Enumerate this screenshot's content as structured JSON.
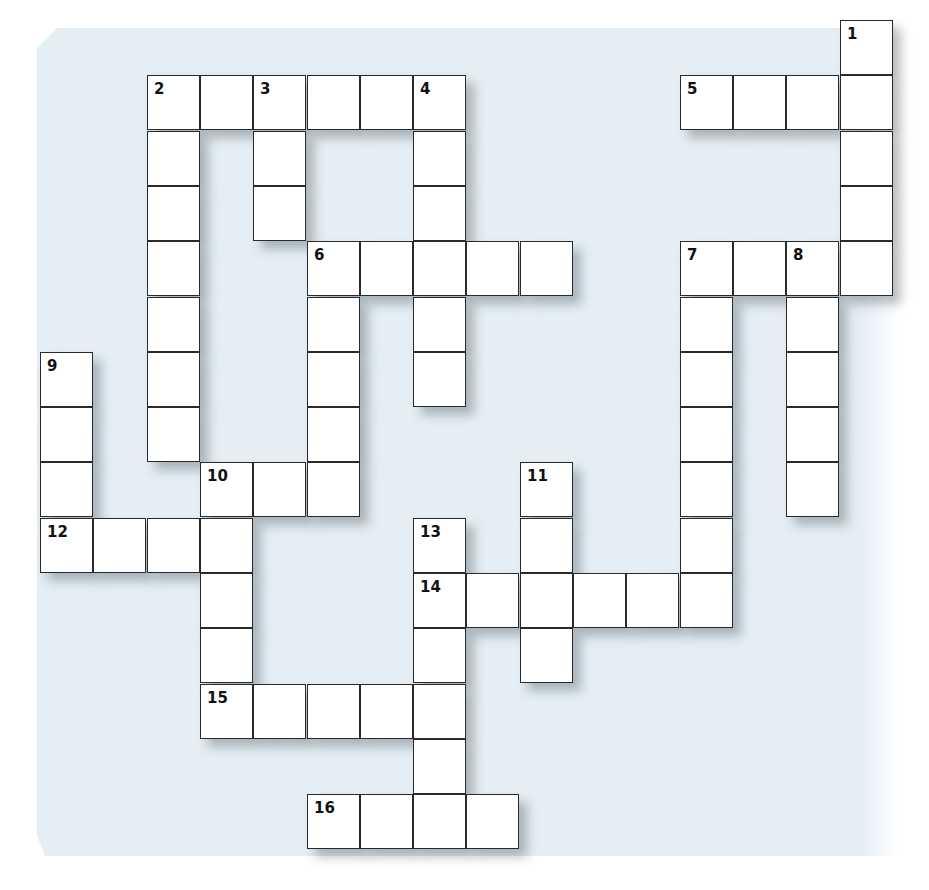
{
  "puzzle": {
    "type": "crossword",
    "grid_origin": {
      "x": 40,
      "y": 20
    },
    "cell_size": {
      "w": 53.3,
      "h": 55.3
    },
    "colors": {
      "background": "#e4eef4",
      "cell": "#ffffff",
      "border": "#2a2a2a",
      "number": "#111111"
    },
    "entries": [
      {
        "number": "1",
        "direction": "down",
        "row": 0,
        "col": 15,
        "length": 5
      },
      {
        "number": "2",
        "direction": "across",
        "row": 1,
        "col": 2,
        "length": 6
      },
      {
        "number": "2",
        "direction": "down",
        "row": 1,
        "col": 2,
        "length": 7
      },
      {
        "number": "3",
        "direction": "down",
        "row": 1,
        "col": 4,
        "length": 3
      },
      {
        "number": "4",
        "direction": "down",
        "row": 1,
        "col": 7,
        "length": 6
      },
      {
        "number": "5",
        "direction": "across",
        "row": 1,
        "col": 12,
        "length": 4
      },
      {
        "number": "6",
        "direction": "across",
        "row": 4,
        "col": 5,
        "length": 5
      },
      {
        "number": "6",
        "direction": "down",
        "row": 4,
        "col": 5,
        "length": 5
      },
      {
        "number": "7",
        "direction": "across",
        "row": 4,
        "col": 12,
        "length": 4
      },
      {
        "number": "7",
        "direction": "down",
        "row": 4,
        "col": 12,
        "length": 7
      },
      {
        "number": "8",
        "direction": "down",
        "row": 4,
        "col": 14,
        "length": 5
      },
      {
        "number": "9",
        "direction": "down",
        "row": 6,
        "col": 0,
        "length": 4
      },
      {
        "number": "10",
        "direction": "across",
        "row": 8,
        "col": 3,
        "length": 3
      },
      {
        "number": "10",
        "direction": "down",
        "row": 8,
        "col": 3,
        "length": 5
      },
      {
        "number": "11",
        "direction": "down",
        "row": 8,
        "col": 9,
        "length": 4
      },
      {
        "number": "12",
        "direction": "across",
        "row": 9,
        "col": 0,
        "length": 4
      },
      {
        "number": "13",
        "direction": "down",
        "row": 9,
        "col": 7,
        "length": 6
      },
      {
        "number": "14",
        "direction": "across",
        "row": 10,
        "col": 7,
        "length": 6
      },
      {
        "number": "15",
        "direction": "across",
        "row": 12,
        "col": 3,
        "length": 5
      },
      {
        "number": "16",
        "direction": "across",
        "row": 14,
        "col": 5,
        "length": 4
      }
    ]
  }
}
